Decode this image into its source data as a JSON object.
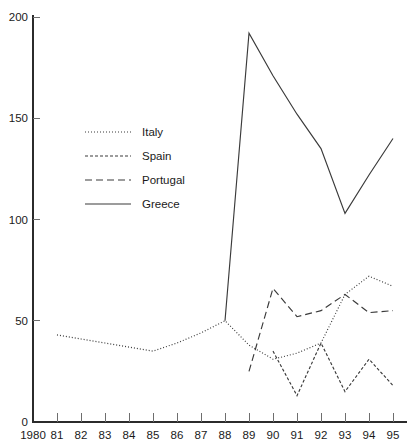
{
  "chart_data": {
    "type": "line",
    "title": "",
    "subtitle": "",
    "xlabel": "",
    "ylabel": "",
    "xlim": [
      1980,
      1995
    ],
    "ylim": [
      0,
      200
    ],
    "grid": false,
    "legend_position": "upper-left-inside",
    "x": [
      1980,
      1981,
      1982,
      1983,
      1984,
      1985,
      1986,
      1987,
      1988,
      1989,
      1990,
      1991,
      1992,
      1993,
      1994,
      1995
    ],
    "x_tick_labels": [
      "1980",
      "81",
      "82",
      "83",
      "84",
      "85",
      "86",
      "87",
      "88",
      "89",
      "90",
      "91",
      "92",
      "93",
      "94",
      "95"
    ],
    "y_tick_values": [
      0,
      50,
      100,
      150,
      200
    ],
    "y_tick_labels": [
      "0",
      "50",
      "100",
      "150",
      "200"
    ],
    "series": [
      {
        "name": "Italy",
        "style": "dotted",
        "dash": "1,2",
        "x": [
          1981,
          1982,
          1983,
          1984,
          1985,
          1986,
          1987,
          1988,
          1989,
          1990,
          1991,
          1992,
          1993,
          1994,
          1995
        ],
        "values": [
          43,
          41,
          39,
          37,
          35,
          39,
          44,
          50,
          38,
          31,
          34,
          39,
          63,
          72,
          67
        ]
      },
      {
        "name": "Spain",
        "style": "dashed-short",
        "dash": "3,2",
        "x": [
          1990,
          1991,
          1992,
          1993,
          1994,
          1995
        ],
        "values": [
          35,
          13,
          39,
          15,
          31,
          18
        ]
      },
      {
        "name": "Portugal",
        "style": "dashed-long",
        "dash": "7,4",
        "x": [
          1989,
          1990,
          1991,
          1992,
          1993,
          1994,
          1995
        ],
        "values": [
          25,
          66,
          52,
          55,
          63,
          54,
          55
        ]
      },
      {
        "name": "Greece",
        "style": "solid",
        "dash": "none",
        "x": [
          1988,
          1989,
          1990,
          1991,
          1992,
          1993,
          1994,
          1995
        ],
        "values": [
          50,
          192,
          171,
          152,
          135,
          103,
          122,
          140
        ]
      }
    ]
  },
  "legend": {
    "entries": [
      {
        "label": "Italy"
      },
      {
        "label": "Spain"
      },
      {
        "label": "Portugal"
      },
      {
        "label": "Greece"
      }
    ]
  }
}
